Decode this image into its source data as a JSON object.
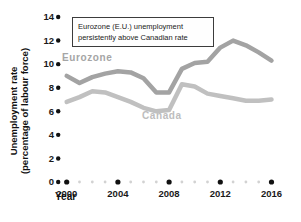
{
  "figure": {
    "annotation": {
      "line1": "Eurozone (E.U.) unemployment",
      "line2": "persistently above Canadian rate"
    },
    "y_axis_title_line1": "Unemployment rate",
    "y_axis_title_line2": "(percentage of labour force)",
    "x_axis_title": "Year",
    "series_labels": {
      "eurozone": "Eurozone",
      "canada": "Canada"
    }
  },
  "chart_data": {
    "type": "line",
    "title": "",
    "xlabel": "Year",
    "ylabel": "Unemployment rate (percentage of labour force)",
    "x": [
      2000,
      2001,
      2002,
      2003,
      2004,
      2005,
      2006,
      2007,
      2008,
      2009,
      2010,
      2011,
      2012,
      2013,
      2014,
      2015,
      2016
    ],
    "series": [
      {
        "name": "Eurozone",
        "color": "#a3a3a3",
        "values": [
          9.0,
          8.4,
          8.9,
          9.2,
          9.4,
          9.3,
          8.8,
          7.6,
          7.6,
          9.6,
          10.1,
          10.2,
          11.4,
          12.0,
          11.6,
          11.0,
          10.3
        ]
      },
      {
        "name": "Canada",
        "color": "#c0c0c0",
        "values": [
          6.8,
          7.2,
          7.7,
          7.6,
          7.2,
          6.8,
          6.3,
          6.0,
          6.1,
          8.3,
          8.1,
          7.5,
          7.3,
          7.1,
          6.9,
          6.9,
          7.0
        ]
      }
    ],
    "ylim": [
      0,
      14
    ],
    "yticks": [
      0,
      2,
      4,
      6,
      8,
      10,
      12,
      14
    ],
    "xtick_years": [
      2000,
      2004,
      2008,
      2012,
      2016
    ],
    "xtick_labels": [
      "2000",
      "2004",
      "2008",
      "2012",
      "2016"
    ],
    "annotation": "Eurozone (E.U.) unemployment persistently above Canadian rate",
    "legend_position": "inline-labels",
    "grid": false,
    "colors": {
      "axis_dot": "#111111",
      "minor_dot": "#d2d2d2",
      "eurozone_line": "#a3a3a3",
      "canada_line": "#c0c0c0"
    }
  }
}
